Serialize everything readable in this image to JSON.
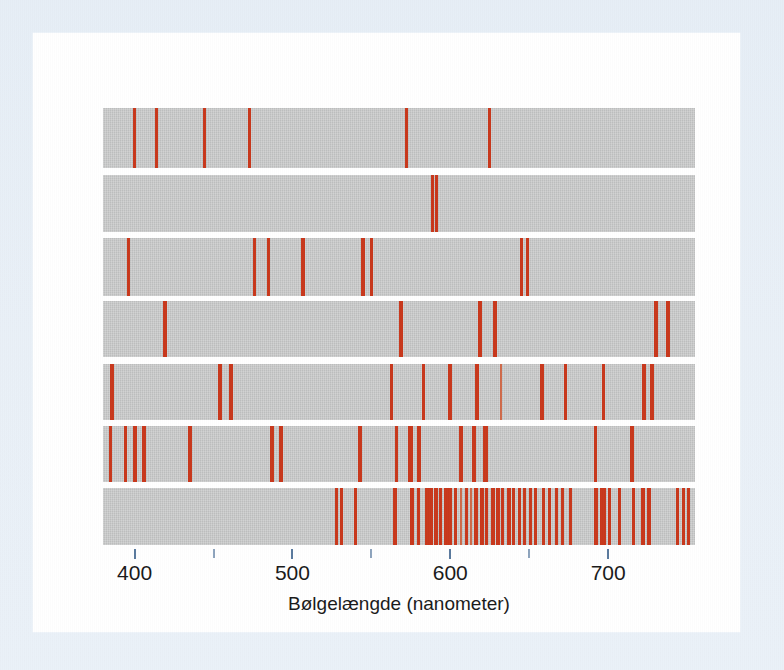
{
  "figure": {
    "axis_title": "Bølgelængde (nanometer)",
    "colors": {
      "line": "#c8381c",
      "band_background": "#c2c3c3",
      "panel": "#ffffff",
      "outer": "#e9f0f7",
      "tick": "#5a7a9e",
      "text": "#1a1a1a"
    }
  },
  "chart_data": {
    "type": "line",
    "title": "",
    "subtitle": "",
    "xlabel": "Bølgelængde (nanometer)",
    "ylabel": "",
    "xlim": [
      380,
      755
    ],
    "grid": false,
    "legend": "none",
    "tick_labels": [
      "400",
      "500",
      "600",
      "700"
    ],
    "major_ticks": [
      400,
      500,
      600,
      700
    ],
    "minor_ticks": [
      450,
      550,
      650
    ],
    "series": [
      {
        "name": "Li",
        "values": [
          400,
          414,
          444,
          473,
          572,
          625
        ],
        "widths": [
          3,
          3,
          3,
          3,
          3,
          3
        ]
      },
      {
        "name": "Na",
        "values": [
          589,
          591
        ],
        "widths": [
          3,
          3
        ]
      },
      {
        "name": "K",
        "values": [
          396,
          476,
          485,
          507,
          545,
          550,
          645,
          649
        ],
        "widths": [
          3,
          3,
          3,
          4,
          4,
          3,
          3,
          3
        ]
      },
      {
        "name": "Rb",
        "values": [
          419,
          569,
          619,
          628,
          730,
          738
        ],
        "widths": [
          4,
          4,
          4,
          4,
          4,
          4
        ]
      },
      {
        "name": "Cs",
        "values": [
          386,
          454,
          461,
          563,
          583,
          600,
          617,
          632,
          658,
          673,
          697,
          723,
          728
        ],
        "widths": [
          4,
          4,
          4,
          3,
          3,
          4,
          4,
          2,
          4,
          3,
          3,
          4,
          4
        ]
      },
      {
        "name": "Hg",
        "values": [
          385,
          394,
          400,
          406,
          435,
          487,
          493,
          543,
          566,
          575,
          580,
          607,
          615,
          622,
          692,
          715
        ],
        "widths": [
          3,
          3,
          4,
          4,
          4,
          4,
          4,
          4,
          3,
          5,
          4,
          4,
          4,
          5,
          3,
          4
        ]
      },
      {
        "name": "Ne",
        "values": [
          528,
          531,
          540,
          565,
          576,
          580,
          585,
          588,
          591,
          594,
          597,
          600,
          603,
          607,
          610,
          613,
          616,
          620,
          623,
          627,
          630,
          633,
          637,
          640,
          644,
          647,
          651,
          654,
          659,
          663,
          667,
          671,
          676,
          692,
          697,
          701,
          707,
          716,
          722,
          726,
          744,
          748,
          751
        ],
        "widths": [
          3,
          3,
          3,
          4,
          4,
          3,
          4,
          4,
          4,
          3,
          4,
          4,
          3,
          2,
          3,
          2,
          4,
          4,
          3,
          4,
          4,
          3,
          4,
          3,
          3,
          3,
          3,
          3,
          3,
          3,
          3,
          3,
          3,
          4,
          6,
          3,
          3,
          3,
          4,
          4,
          3,
          3,
          3
        ]
      }
    ]
  },
  "rows": [
    {
      "label": "Li",
      "top": 0,
      "height": 60
    },
    {
      "label": "Na",
      "top": 67,
      "height": 57
    },
    {
      "label": "K",
      "top": 130,
      "height": 58
    },
    {
      "label": "Rb",
      "top": 193,
      "height": 56
    },
    {
      "label": "Cs",
      "top": 256,
      "height": 56
    },
    {
      "label": "Hg",
      "top": 318,
      "height": 56
    },
    {
      "label": "Ne",
      "top": 380,
      "height": 57
    }
  ]
}
